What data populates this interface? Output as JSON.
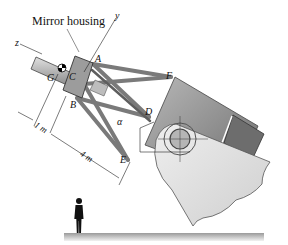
{
  "figure": {
    "title_label": "Mirror housing",
    "axes": {
      "y": "y",
      "z": "z"
    },
    "points": {
      "A": "A",
      "B": "B",
      "C": "C",
      "D": "D",
      "E": "E",
      "F": "F",
      "G": "G"
    },
    "angle_label": "α",
    "dimensions": {
      "short": "1 m",
      "long": "4 m"
    },
    "colors": {
      "strut": "#8a8a8a",
      "housing": "#9a9a9a",
      "body_dark": "#7d7d7d",
      "body_light": "#d9d9d9",
      "ground": "#bdbdbd",
      "line": "#222222"
    }
  }
}
